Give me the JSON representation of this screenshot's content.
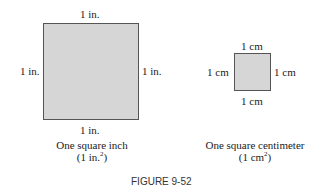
{
  "figure": {
    "label": "FIGURE 9-52"
  },
  "square_inch": {
    "top": "1 in.",
    "left": "1 in.",
    "right": "1 in.",
    "bottom": "1 in.",
    "caption_line1": "One square inch",
    "caption_line2_prefix": "(1 in.",
    "caption_line2_sup": "2",
    "caption_line2_suffix": ")",
    "fill_color": "#d6d6d6",
    "border_color": "#555555"
  },
  "square_cm": {
    "top": "1 cm",
    "left": "1 cm",
    "right": "1 cm",
    "bottom": "1 cm",
    "caption_line1": "One square centimeter",
    "caption_line2_prefix": "(1 cm",
    "caption_line2_sup": "2",
    "caption_line2_suffix": ")",
    "fill_color": "#d6d6d6",
    "border_color": "#555555"
  }
}
